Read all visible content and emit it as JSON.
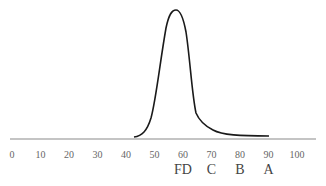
{
  "chart_data": {
    "type": "line",
    "title": "",
    "xlabel": "",
    "ylabel": "",
    "xlim": [
      0,
      100
    ],
    "grid": false,
    "legend": null,
    "x_ticks": [
      0,
      10,
      20,
      30,
      40,
      50,
      60,
      70,
      80,
      90,
      100
    ],
    "x_tick_labels": [
      "0",
      "10",
      "20",
      "30",
      "40",
      "50",
      "60",
      "70",
      "80",
      "90",
      "100"
    ],
    "grade_labels": [
      {
        "label": "FD",
        "x": 60
      },
      {
        "label": "C",
        "x": 70
      },
      {
        "label": "B",
        "x": 80
      },
      {
        "label": "A",
        "x": 90
      }
    ],
    "series": [
      {
        "name": "score distribution",
        "x": [
          42,
          46,
          50,
          53,
          55,
          56,
          57,
          58,
          59,
          61,
          63,
          64,
          66,
          70,
          75,
          80,
          90
        ],
        "y": [
          0.01,
          0.05,
          0.16,
          0.42,
          0.78,
          0.93,
          0.99,
          0.96,
          0.82,
          0.5,
          0.22,
          0.15,
          0.1,
          0.05,
          0.02,
          0.01,
          0.005
        ]
      }
    ],
    "annotations": [
      "peak near 57",
      "shoulder near 64-66 with long right tail"
    ]
  },
  "colors": {
    "curve": "#1a1a1a",
    "axis": "#8a8a8a",
    "tick_text": "#666666",
    "grade_text": "#444444"
  }
}
